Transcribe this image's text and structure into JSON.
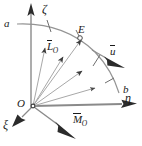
{
  "figure": {
    "type": "vector-mechanics-diagram",
    "background_color": "#ffffff",
    "ray_color": "#9a9a9a",
    "arc_color": "#8c8c8c",
    "axis_color": "#7a7a7a",
    "arrowhead_color": "#3c3c3c",
    "label_color": "#1a1a1a"
  },
  "axes": [
    {
      "id": "zeta",
      "label": "ζ",
      "x": 42,
      "y": 4,
      "direction": "up"
    },
    {
      "id": "eta",
      "label": "η",
      "x": 126,
      "y": 99,
      "direction": "right"
    },
    {
      "id": "xi",
      "label": "ξ",
      "x": 6,
      "y": 124,
      "direction": "down-left"
    }
  ],
  "points": [
    {
      "id": "origin",
      "label": "O",
      "x": 18,
      "y": 100
    },
    {
      "id": "arc-start",
      "label": "a",
      "x": 5,
      "y": 24
    },
    {
      "id": "arc-end",
      "label": "b",
      "x": 124,
      "y": 88
    },
    {
      "id": "trace-point",
      "label": "E",
      "x": 80,
      "y": 27
    }
  ],
  "vectors": [
    {
      "id": "u-vector",
      "label": "u",
      "overbar": true,
      "x": 110,
      "y": 47
    },
    {
      "id": "L-vector",
      "label": "L",
      "subscript": "O",
      "overbar": true,
      "x": 48,
      "y": 43
    },
    {
      "id": "M-vector",
      "label": "M",
      "subscript": "O",
      "overbar": true,
      "x": 74,
      "y": 117
    }
  ],
  "geometry": {
    "origin": {
      "x": 33,
      "y": 106
    },
    "rays": [
      {
        "id": "ray-1",
        "tip_x": 45,
        "tip_y": 44
      },
      {
        "id": "ray-2",
        "tip_x": 64,
        "tip_y": 53
      },
      {
        "id": "ray-3",
        "tip_x": 84,
        "tip_y": 68
      },
      {
        "id": "ray-4",
        "tip_x": 98,
        "tip_y": 85
      },
      {
        "id": "ray-5",
        "tip_x": 81,
        "tip_y": 36
      }
    ],
    "arc": {
      "start_x": 18,
      "start_y": 25,
      "end_x": 118,
      "end_y": 92
    },
    "zeta_axis": {
      "x1": 31,
      "y1": 108,
      "x2": 31,
      "y2": 10
    },
    "eta_axis": {
      "x1": 33,
      "y1": 106,
      "x2": 130,
      "y2": 103
    },
    "xi_axis": {
      "x1": 33,
      "y1": 106,
      "x2": 10,
      "y2": 126
    },
    "m_vector": {
      "x1": 33,
      "y1": 106,
      "x2": 74,
      "y2": 137
    }
  }
}
